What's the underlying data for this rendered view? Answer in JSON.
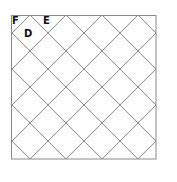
{
  "diagram": {
    "type": "diagonal-grid-square",
    "box": {
      "x": 11,
      "y": 15,
      "width": 145,
      "height": 144
    },
    "grid_spacing": 36,
    "line_color": "#8a8a8a",
    "border_color": "#8a8a8a",
    "labels": [
      {
        "id": "F",
        "text": "F",
        "x": 12,
        "y": 24
      },
      {
        "id": "E",
        "text": "E",
        "x": 43,
        "y": 24
      },
      {
        "id": "D",
        "text": "D",
        "x": 24,
        "y": 37
      }
    ]
  }
}
